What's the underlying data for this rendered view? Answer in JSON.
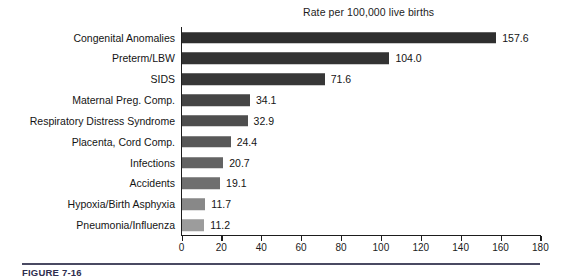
{
  "figure": {
    "caption": "FIGURE 7-16",
    "background": "#ffffff"
  },
  "chart_data": {
    "type": "bar",
    "orientation": "horizontal",
    "title": "Rate per 100,000 live births",
    "xlabel": "",
    "ylabel": "",
    "xlim": [
      0,
      180
    ],
    "xticks": [
      0,
      20,
      40,
      60,
      80,
      100,
      120,
      140,
      160,
      180
    ],
    "grid": false,
    "legend": false,
    "categories": [
      "Congenital Anomalies",
      "Preterm/LBW",
      "SIDS",
      "Maternal Preg. Comp.",
      "Respiratory Distress Syndrome",
      "Placenta, Cord Comp.",
      "Infections",
      "Accidents",
      "Hypoxia/Birth Asphyxia",
      "Pneumonia/Influenza"
    ],
    "values": [
      157.6,
      104.0,
      71.6,
      34.1,
      32.9,
      24.4,
      20.7,
      19.1,
      11.7,
      11.2
    ],
    "data_labels": [
      "157.6",
      "104.0",
      "71.6",
      "34.1",
      "32.9",
      "24.4",
      "20.7",
      "19.1",
      "11.7",
      "11.2"
    ],
    "bar_colors": [
      "#2f2f2f",
      "#333333",
      "#373737",
      "#454545",
      "#4e4e4e",
      "#585858",
      "#636363",
      "#6f6f6f",
      "#888888",
      "#9c9c9c"
    ]
  }
}
